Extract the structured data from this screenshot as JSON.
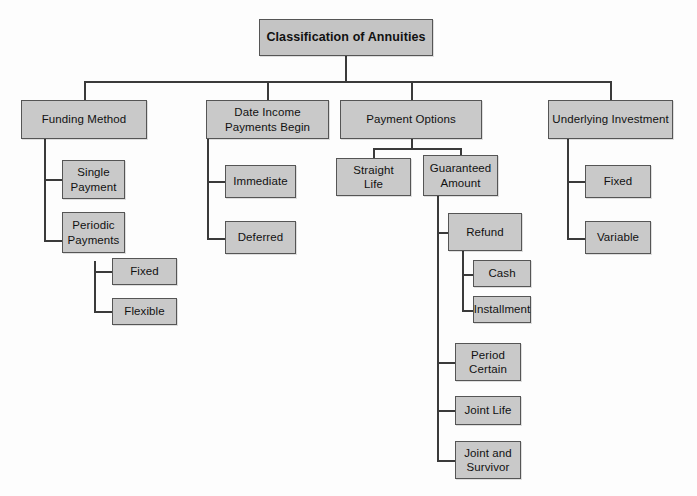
{
  "diagram": {
    "title": "Classification of Annuities",
    "type": "organizational-tree",
    "box_fill_color": "#c9c9c9",
    "box_border_color": "#555555",
    "connector_color": "#3a3a3a",
    "background_color": "#fdfdfd",
    "root": {
      "label": "Classification of Annuities"
    },
    "branches": [
      {
        "label": "Funding Method",
        "children": [
          {
            "label": "Single\nPayment",
            "children": []
          },
          {
            "label": "Periodic\nPayments",
            "children": [
              {
                "label": "Fixed"
              },
              {
                "label": "Flexible"
              }
            ]
          }
        ]
      },
      {
        "label": "Date Income\nPayments Begin",
        "children": [
          {
            "label": "Immediate",
            "children": []
          },
          {
            "label": "Deferred",
            "children": []
          }
        ]
      },
      {
        "label": "Payment Options",
        "children": [
          {
            "label": "Straight\nLife",
            "children": []
          },
          {
            "label": "Guaranteed\nAmount",
            "children": [
              {
                "label": "Refund",
                "children": [
                  {
                    "label": "Cash"
                  },
                  {
                    "label": "Installment"
                  }
                ]
              },
              {
                "label": "Period\nCertain"
              },
              {
                "label": "Joint Life"
              },
              {
                "label": "Joint and\nSurvivor"
              }
            ]
          }
        ]
      },
      {
        "label": "Underlying Investment",
        "children": [
          {
            "label": "Fixed",
            "children": []
          },
          {
            "label": "Variable",
            "children": []
          }
        ]
      }
    ],
    "nodes": {
      "root": "Classification of Annuities",
      "funding_method": "Funding Method",
      "single_payment": "Single\nPayment",
      "periodic_payments": "Periodic\nPayments",
      "fm_fixed": "Fixed",
      "fm_flexible": "Flexible",
      "date_income": "Date Income\nPayments Begin",
      "immediate": "Immediate",
      "deferred": "Deferred",
      "payment_options": "Payment Options",
      "straight_life": "Straight\nLife",
      "guaranteed_amount": "Guaranteed\nAmount",
      "refund": "Refund",
      "cash": "Cash",
      "installment": "Installment",
      "period_certain": "Period\nCertain",
      "joint_life": "Joint Life",
      "joint_and_survivor": "Joint and\nSurvivor",
      "underlying_investment": "Underlying Investment",
      "ui_fixed": "Fixed",
      "ui_variable": "Variable"
    }
  }
}
